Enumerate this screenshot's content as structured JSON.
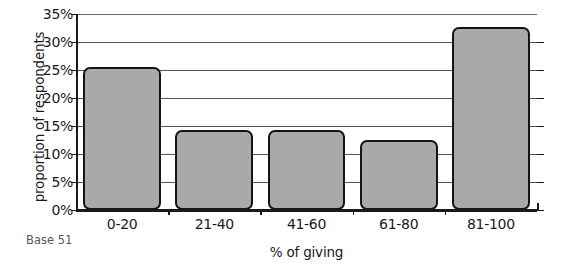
{
  "chart_data": {
    "type": "bar",
    "title": "",
    "subtitle": "",
    "xlabel": "% of giving",
    "ylabel": "proportion of respondents",
    "categories": [
      "0-20",
      "21-40",
      "41-60",
      "61-80",
      "81-100"
    ],
    "values": [
      25.5,
      14.3,
      14.3,
      12.5,
      32.7
    ],
    "value_format": "percent",
    "ylim": [
      0,
      35
    ],
    "ytick_values": [
      0,
      5,
      10,
      15,
      20,
      25,
      30,
      35
    ],
    "ytick_labels": [
      "0%",
      "5%",
      "10%",
      "15%",
      "20%",
      "25%",
      "30%",
      "35%"
    ],
    "grid": true,
    "grid_axis": "y",
    "legend": false,
    "legend_position": "none",
    "annotations": [
      "Base 51"
    ],
    "bar_fill_color": "#a9a9a9",
    "bar_edge_color": "#141414",
    "gridline_color": "#565656",
    "axis_color": "#1a1a1a",
    "background_color": "#ffffff",
    "annotation_color": "#585858"
  },
  "notes": {
    "base": "Base 51"
  }
}
